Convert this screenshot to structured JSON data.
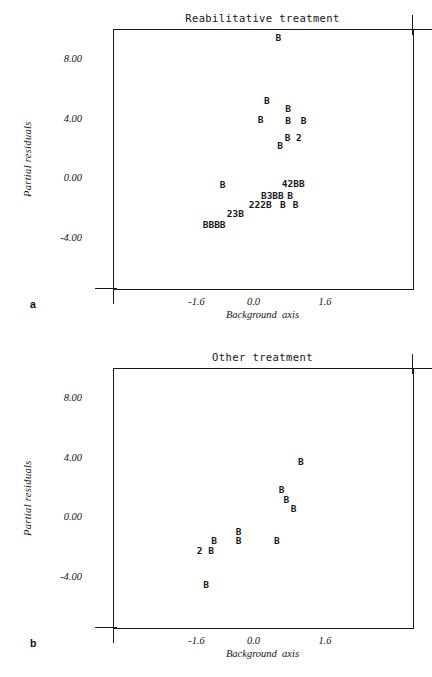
{
  "figure": {
    "axis_labels": {
      "y": "Partial residuals",
      "x": "Background  axis"
    },
    "y_ticks": [
      "8.00",
      "4.00",
      "0.00",
      "-4.00"
    ],
    "x_ticks": [
      "-1.6",
      "0.0",
      "1.6"
    ],
    "panel_letters": {
      "a": "a",
      "b": "b"
    }
  },
  "panels": [
    {
      "id": "a",
      "letter": "a",
      "title": "Reabilitative treatment",
      "markers": [
        {
          "text": "B",
          "x": 0.62,
          "y": 9.55
        },
        {
          "text": "B",
          "x": 0.33,
          "y": 5.3
        },
        {
          "text": "B",
          "x": 0.86,
          "y": 4.75
        },
        {
          "text": "B",
          "x": 0.18,
          "y": 4.05
        },
        {
          "text": "B",
          "x": 0.86,
          "y": 4.0
        },
        {
          "text": "B",
          "x": 1.25,
          "y": 4.0
        },
        {
          "text": "B 2",
          "x": 0.99,
          "y": 2.85
        },
        {
          "text": "B",
          "x": 0.66,
          "y": 2.3
        },
        {
          "text": "B",
          "x": -0.77,
          "y": -0.35
        },
        {
          "text": "42BB",
          "x": 0.99,
          "y": -0.3
        },
        {
          "text": "B3BB",
          "x": 0.47,
          "y": -1.05
        },
        {
          "text": "B",
          "x": 0.91,
          "y": -1.05
        },
        {
          "text": "222B",
          "x": 0.17,
          "y": -1.65
        },
        {
          "text": "B",
          "x": 0.73,
          "y": -1.65
        },
        {
          "text": "B",
          "x": 1.05,
          "y": -1.65
        },
        {
          "text": "23B",
          "x": -0.45,
          "y": -2.3
        },
        {
          "text": "BBBB",
          "x": -0.98,
          "y": -3.0
        }
      ]
    },
    {
      "id": "b",
      "letter": "b",
      "title": "Other treatment",
      "markers": [
        {
          "text": "B",
          "x": 1.18,
          "y": 3.85
        },
        {
          "text": "B",
          "x": 0.7,
          "y": 1.95
        },
        {
          "text": "B",
          "x": 0.82,
          "y": 1.25
        },
        {
          "text": "B",
          "x": 1.0,
          "y": 0.65
        },
        {
          "text": "B",
          "x": -0.37,
          "y": -0.85
        },
        {
          "text": "B",
          "x": -0.98,
          "y": -1.45
        },
        {
          "text": "B",
          "x": -0.37,
          "y": -1.45
        },
        {
          "text": "B",
          "x": 0.58,
          "y": -1.45
        },
        {
          "text": "2 B",
          "x": -1.2,
          "y": -2.15
        },
        {
          "text": "B",
          "x": -1.18,
          "y": -4.45
        }
      ]
    }
  ]
}
